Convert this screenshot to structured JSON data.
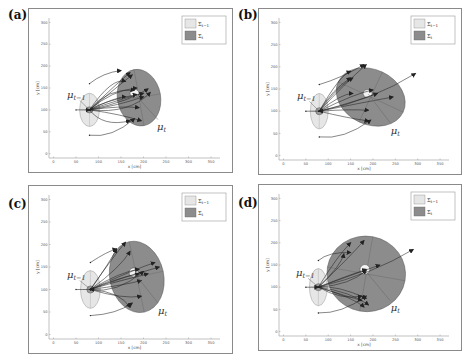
{
  "figure": {
    "panels": [
      {
        "id": "a",
        "label": "(a)",
        "frame": {
          "left": 28,
          "top": 8,
          "width": 205,
          "height": 165
        },
        "label_pos": {
          "left": 8,
          "top": 8
        },
        "prior": {
          "cx": 80,
          "cy": 100,
          "rx": 22,
          "ry": 38
        },
        "inner_prior": {
          "cx": 80,
          "cy": 100,
          "rx": 8,
          "ry": 7
        },
        "posterior": {
          "cx": 190,
          "cy": 128,
          "rx": 48,
          "ry": 65,
          "rot": -10
        },
        "inner_posterior": {
          "cx": 180,
          "cy": 138,
          "rx": 10,
          "ry": 9
        },
        "mu_prev": {
          "x": 30,
          "y": 128,
          "lead_x1": 58,
          "lead_y1": 122,
          "lead_x2": 78,
          "lead_y2": 102
        },
        "mu_t": {
          "x": 230,
          "y": 68,
          "lead_x1": 232,
          "lead_y1": 78,
          "lead_x2": 182,
          "lead_y2": 134
        },
        "arrows": [
          [
            80,
            100,
            150,
            160,
            175,
            180
          ],
          [
            80,
            100,
            130,
            175,
            160,
            165
          ],
          [
            80,
            100,
            120,
            150,
            180,
            145
          ],
          [
            80,
            100,
            140,
            130,
            160,
            130
          ],
          [
            80,
            100,
            150,
            110,
            190,
            105
          ],
          [
            80,
            100,
            170,
            120,
            210,
            148
          ],
          [
            80,
            100,
            150,
            90,
            195,
            75
          ],
          [
            80,
            100,
            170,
            90,
            215,
            140
          ],
          [
            80,
            100,
            110,
            60,
            170,
            75
          ],
          [
            80,
            100,
            130,
            145,
            185,
            150
          ],
          [
            80,
            100,
            150,
            125,
            200,
            138
          ],
          [
            80,
            100,
            145,
            110,
            200,
            130
          ],
          [
            80,
            160,
            110,
            185,
            150,
            190
          ],
          [
            80,
            42,
            130,
            35,
            180,
            80
          ],
          [
            50,
            100,
            80,
            100,
            80,
            100
          ],
          [
            80,
            100,
            140,
            160,
            170,
            185
          ],
          [
            80,
            100,
            110,
            120,
            185,
            135
          ]
        ]
      },
      {
        "id": "b",
        "label": "(b)",
        "frame": {
          "left": 258,
          "top": 8,
          "width": 204,
          "height": 167
        },
        "label_pos": {
          "left": 238,
          "top": 8
        },
        "prior": {
          "cx": 80,
          "cy": 100,
          "rx": 20,
          "ry": 40
        },
        "inner_prior": {
          "cx": 80,
          "cy": 100,
          "rx": 8,
          "ry": 8
        },
        "posterior": {
          "cx": 195,
          "cy": 132,
          "rx": 80,
          "ry": 62,
          "rot": 25
        },
        "inner_posterior": {
          "cx": 188,
          "cy": 140,
          "rx": 10,
          "ry": 9
        },
        "mu_prev": {
          "x": 30,
          "y": 128,
          "lead_x1": 58,
          "lead_y1": 122,
          "lead_x2": 78,
          "lead_y2": 102
        },
        "mu_t": {
          "x": 240,
          "y": 62,
          "lead_x1": 240,
          "lead_y1": 72,
          "lead_x2": 190,
          "lead_y2": 138
        },
        "arrows": [
          [
            80,
            100,
            140,
            165,
            185,
            205
          ],
          [
            80,
            100,
            125,
            180,
            150,
            190
          ],
          [
            80,
            100,
            120,
            155,
            155,
            175
          ],
          [
            80,
            100,
            130,
            140,
            155,
            140
          ],
          [
            80,
            100,
            150,
            105,
            190,
            102
          ],
          [
            80,
            100,
            180,
            120,
            245,
            132
          ],
          [
            80,
            100,
            200,
            125,
            295,
            185
          ],
          [
            80,
            100,
            160,
            140,
            200,
            148
          ],
          [
            80,
            100,
            140,
            115,
            210,
            140
          ],
          [
            80,
            100,
            140,
            85,
            190,
            78
          ],
          [
            80,
            160,
            130,
            175,
            180,
            205
          ],
          [
            80,
            42,
            135,
            35,
            195,
            80
          ],
          [
            50,
            100,
            80,
            100,
            80,
            100
          ],
          [
            80,
            100,
            110,
            150,
            150,
            175
          ]
        ]
      },
      {
        "id": "c",
        "label": "(c)",
        "frame": {
          "left": 28,
          "top": 185,
          "width": 205,
          "height": 169
        },
        "label_pos": {
          "left": 8,
          "top": 197
        },
        "prior": {
          "cx": 82,
          "cy": 100,
          "rx": 22,
          "ry": 42
        },
        "inner_prior": {
          "cx": 82,
          "cy": 100,
          "rx": 8,
          "ry": 8
        },
        "posterior": {
          "cx": 185,
          "cy": 128,
          "rx": 60,
          "ry": 80,
          "rot": -12
        },
        "inner_posterior": {
          "cx": 178,
          "cy": 138,
          "rx": 10,
          "ry": 10
        },
        "mu_prev": {
          "x": 30,
          "y": 125,
          "lead_x1": 58,
          "lead_y1": 120,
          "lead_x2": 80,
          "lead_y2": 102
        },
        "mu_t": {
          "x": 232,
          "y": 60,
          "lead_x1": 232,
          "lead_y1": 70,
          "lead_x2": 180,
          "lead_y2": 136
        },
        "arrows": [
          [
            82,
            100,
            150,
            150,
            170,
            185
          ],
          [
            82,
            100,
            130,
            170,
            160,
            205
          ],
          [
            82,
            100,
            125,
            160,
            140,
            190
          ],
          [
            82,
            100,
            140,
            125,
            190,
            135
          ],
          [
            82,
            100,
            160,
            130,
            235,
            150
          ],
          [
            82,
            100,
            180,
            145,
            225,
            160
          ],
          [
            82,
            100,
            160,
            110,
            195,
            120
          ],
          [
            82,
            100,
            150,
            140,
            190,
            145
          ],
          [
            82,
            100,
            155,
            78,
            195,
            85
          ],
          [
            82,
            100,
            150,
            95,
            170,
            60
          ],
          [
            82,
            100,
            130,
            115,
            210,
            135
          ],
          [
            82,
            160,
            120,
            185,
            140,
            190
          ],
          [
            82,
            42,
            140,
            45,
            175,
            70
          ],
          [
            50,
            100,
            82,
            100,
            82,
            100
          ],
          [
            82,
            100,
            140,
            90,
            200,
            140
          ]
        ]
      },
      {
        "id": "d",
        "label": "(d)",
        "frame": {
          "left": 258,
          "top": 184,
          "width": 204,
          "height": 167
        },
        "label_pos": {
          "left": 238,
          "top": 196
        },
        "prior": {
          "cx": 78,
          "cy": 100,
          "rx": 20,
          "ry": 42
        },
        "inner_prior": {
          "cx": 78,
          "cy": 100,
          "rx": 8,
          "ry": 8
        },
        "posterior": {
          "cx": 185,
          "cy": 130,
          "rx": 88,
          "ry": 85,
          "rot": 10
        },
        "inner_posterior": {
          "cx": 182,
          "cy": 140,
          "rx": 11,
          "ry": 11
        },
        "mu_prev": {
          "x": 28,
          "y": 125,
          "lead_x1": 55,
          "lead_y1": 120,
          "lead_x2": 76,
          "lead_y2": 102
        },
        "mu_t": {
          "x": 240,
          "y": 60,
          "lead_x1": 238,
          "lead_y1": 70,
          "lead_x2": 184,
          "lead_y2": 136
        },
        "arrows": [
          [
            78,
            100,
            150,
            170,
            180,
            205
          ],
          [
            78,
            100,
            120,
            170,
            150,
            200
          ],
          [
            78,
            100,
            130,
            150,
            135,
            175
          ],
          [
            78,
            100,
            140,
            125,
            185,
            140
          ],
          [
            78,
            100,
            160,
            130,
            215,
            150
          ],
          [
            78,
            100,
            200,
            130,
            290,
            185
          ],
          [
            78,
            100,
            150,
            105,
            185,
            138
          ],
          [
            78,
            100,
            140,
            80,
            175,
            70
          ],
          [
            78,
            100,
            150,
            90,
            190,
            60
          ],
          [
            78,
            100,
            120,
            105,
            185,
            75
          ],
          [
            78,
            100,
            160,
            75,
            180,
            55
          ],
          [
            78,
            160,
            100,
            180,
            150,
            178
          ],
          [
            78,
            42,
            130,
            40,
            185,
            80
          ],
          [
            50,
            100,
            78,
            100,
            78,
            100
          ],
          [
            78,
            100,
            130,
            70,
            175,
            80
          ]
        ]
      }
    ],
    "legend": {
      "prior_label": "Σ",
      "prior_sub": "t−1",
      "posterior_label": "Σ",
      "posterior_sub": "t"
    },
    "annotations": {
      "mu_prev_symbol": "μ",
      "mu_prev_sub": "t−1",
      "mu_t_symbol": "μ",
      "mu_t_sub": "t"
    },
    "axes": {
      "xlabel": "x [cm]",
      "ylabel": "y [cm]",
      "xticks": [
        0,
        50,
        100,
        150,
        200,
        250,
        300,
        350
      ],
      "yticks": [
        0,
        50,
        100,
        150,
        200,
        250,
        300
      ],
      "xlim": [
        -10,
        370
      ],
      "ylim": [
        -10,
        310
      ]
    },
    "colors": {
      "prior_fill": "#e6e6e6",
      "posterior_fill": "#8c8c8c",
      "inner_fill": "#f2f2f2",
      "arrow": "#222222",
      "frame": "#8a8a8a",
      "axis": "#999999"
    }
  },
  "chart_data": {
    "type": "scatter",
    "xlabel": "x [cm]",
    "ylabel": "y [cm]",
    "xlim": [
      0,
      350
    ],
    "ylim": [
      0,
      300
    ],
    "xticks": [
      0,
      50,
      100,
      150,
      200,
      250,
      300,
      350
    ],
    "yticks": [
      0,
      50,
      100,
      150,
      200,
      250,
      300
    ],
    "legend": [
      "Σ_{t-1}",
      "Σ_t"
    ],
    "annotations": [
      "μ_{t-1}",
      "μ_t"
    ],
    "panels": [
      {
        "label": "(a)",
        "mu_prev": [
          80,
          100
        ],
        "mu_t": [
          180,
          138
        ],
        "sigma_prev_halfwidths": [
          22,
          38
        ],
        "sigma_t_halfwidths": [
          48,
          65
        ]
      },
      {
        "label": "(b)",
        "mu_prev": [
          80,
          100
        ],
        "mu_t": [
          188,
          140
        ],
        "sigma_prev_halfwidths": [
          20,
          40
        ],
        "sigma_t_halfwidths": [
          80,
          62
        ]
      },
      {
        "label": "(c)",
        "mu_prev": [
          82,
          100
        ],
        "mu_t": [
          178,
          138
        ],
        "sigma_prev_halfwidths": [
          22,
          42
        ],
        "sigma_t_halfwidths": [
          60,
          80
        ]
      },
      {
        "label": "(d)",
        "mu_prev": [
          78,
          100
        ],
        "mu_t": [
          182,
          140
        ],
        "sigma_prev_halfwidths": [
          20,
          42
        ],
        "sigma_t_halfwidths": [
          88,
          85
        ]
      }
    ]
  }
}
